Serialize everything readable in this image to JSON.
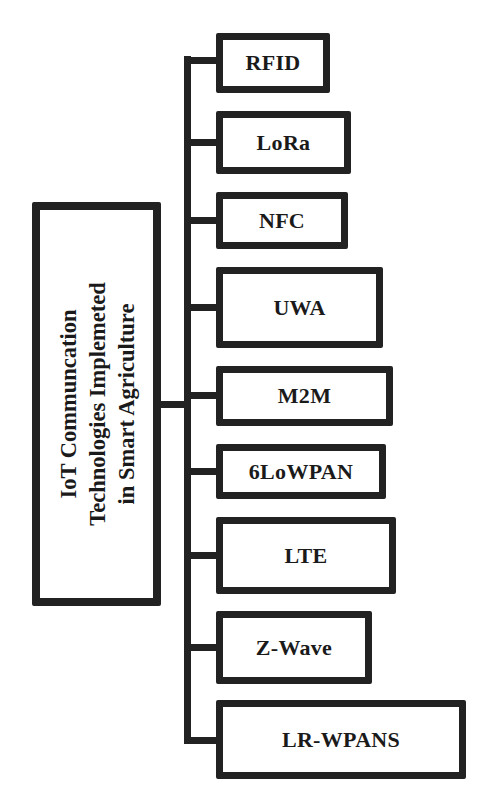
{
  "diagram": {
    "root": {
      "lines": [
        "IoT Communcation",
        "Technologies Implemeted",
        "in Smart Agriculture"
      ]
    },
    "children": [
      {
        "label": "RFID",
        "left": 216,
        "top": 33,
        "width": 114,
        "height": 60,
        "connector_y": 60
      },
      {
        "label": "LoRa",
        "left": 216,
        "top": 111,
        "width": 135,
        "height": 63,
        "connector_y": 142
      },
      {
        "label": "NFC",
        "left": 216,
        "top": 192,
        "width": 132,
        "height": 57,
        "connector_y": 220
      },
      {
        "label": "UWA",
        "left": 216,
        "top": 267,
        "width": 167,
        "height": 81,
        "connector_y": 307
      },
      {
        "label": "M2M",
        "left": 216,
        "top": 366,
        "width": 177,
        "height": 60,
        "connector_y": 395
      },
      {
        "label": "6LoWPAN",
        "left": 216,
        "top": 444,
        "width": 170,
        "height": 55,
        "connector_y": 471
      },
      {
        "label": "LTE",
        "left": 216,
        "top": 517,
        "width": 180,
        "height": 77,
        "connector_y": 555
      },
      {
        "label": "Z-Wave",
        "left": 216,
        "top": 611,
        "width": 156,
        "height": 73,
        "connector_y": 647
      },
      {
        "label": "LR-WPANS",
        "left": 216,
        "top": 700,
        "width": 250,
        "height": 79,
        "connector_y": 740
      }
    ],
    "colors": {
      "stroke": "#222222",
      "fill": "#ffffff",
      "text": "#1a1a1a"
    }
  }
}
